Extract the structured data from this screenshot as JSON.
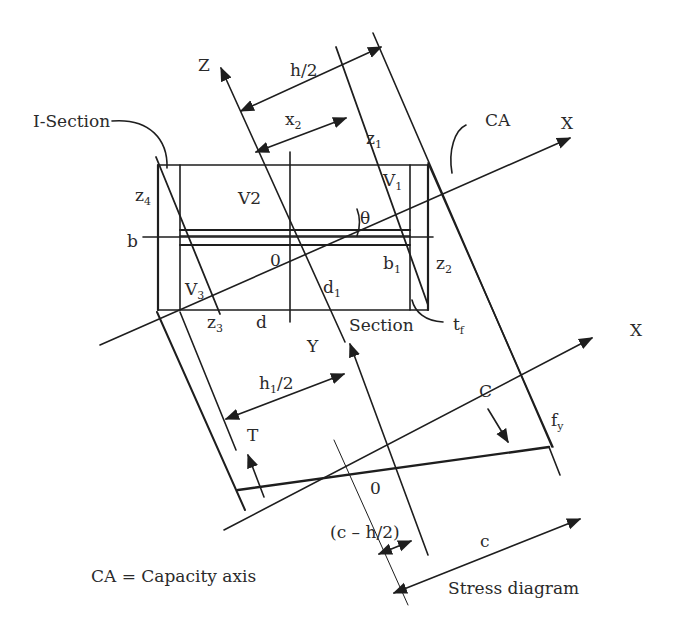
{
  "figure": {
    "colors": {
      "line": "#1e1e1e",
      "background": "#ffffff",
      "text": "#2a2a2a"
    }
  },
  "labels": {
    "i_section": "I-Section",
    "z_axis": "Z",
    "h_half": "h/2",
    "x2": "x",
    "x2_sub": "2",
    "z1": "z",
    "z1_sub": "1",
    "ca": "CA",
    "x_axis_top": "X",
    "z4": "z",
    "z4_sub": "4",
    "v2": "V2",
    "v1": "V",
    "v1_sub": "1",
    "theta": "θ",
    "b": "b",
    "origin_top": "0",
    "b1": "b",
    "b1_sub": "1",
    "z2": "z",
    "z2_sub": "2",
    "v3": "V",
    "v3_sub": "3",
    "d1": "d",
    "d1_sub": "1",
    "z3": "z",
    "z3_sub": "3",
    "d": "d",
    "section": "Section",
    "tf": "t",
    "tf_sub": "f",
    "y_axis": "Y",
    "x_axis_bottom": "X",
    "h1_half_main": "h",
    "h1_half_sub": "1",
    "h1_half_tail": "/2",
    "c_force": "C",
    "fy": "f",
    "fy_sub": "y",
    "t_force": "T",
    "origin_bottom": "0",
    "c_minus_h2": "(c – h/2)",
    "c": "c",
    "stress_diagram": "Stress diagram",
    "legend": "CA = Capacity axis"
  }
}
